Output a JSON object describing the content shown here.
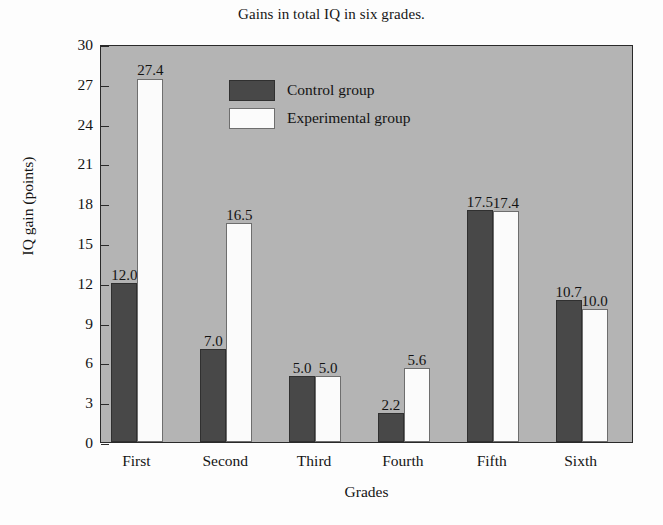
{
  "chart_data": {
    "type": "bar",
    "title": "Gains in total IQ in six grades.",
    "xlabel": "Grades",
    "ylabel": "IQ gain (points)",
    "categories": [
      "First",
      "Second",
      "Third",
      "Fourth",
      "Fifth",
      "Sixth"
    ],
    "series": [
      {
        "name": "Control group",
        "color": "#484848",
        "values": [
          12.0,
          7.0,
          5.0,
          2.2,
          17.5,
          10.7
        ],
        "labels": [
          "12.0",
          "7.0",
          "5.0",
          "2.2",
          "17.5",
          "10.7"
        ]
      },
      {
        "name": "Experimental group",
        "color": "#fbfbfb",
        "values": [
          27.4,
          16.5,
          5.0,
          5.6,
          17.4,
          10.0
        ],
        "labels": [
          "27.4",
          "16.5",
          "5.0",
          "5.6",
          "17.4",
          "10.0"
        ]
      }
    ],
    "ylim": [
      0,
      30
    ],
    "yticks": [
      0,
      3,
      6,
      9,
      12,
      15,
      18,
      21,
      24,
      27,
      30
    ],
    "ytick_labels": [
      "0",
      "3",
      "6",
      "9",
      "12",
      "15",
      "18",
      "21",
      "24",
      "27",
      "30"
    ],
    "grid": false,
    "legend_position": "top-center-left",
    "plot_background": "#b4b4b4",
    "figure_background": "#fdfdfd",
    "axis_color": "#2a2a2a"
  },
  "legend": {
    "items": [
      {
        "label": "Control group",
        "style": "control"
      },
      {
        "label": "Experimental group",
        "style": "experimental"
      }
    ]
  }
}
